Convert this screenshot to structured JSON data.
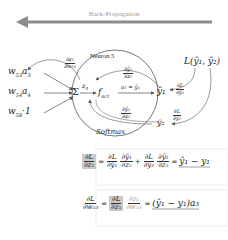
{
  "header": {
    "title": "Back-Propagation"
  },
  "inputs": [
    {
      "weight": "w",
      "weight_sub": "53",
      "act": "a",
      "act_sub": "3"
    },
    {
      "weight": "w",
      "weight_sub": "54",
      "act": "a",
      "act_sub": "4"
    },
    {
      "weight": "w",
      "weight_sub": "58",
      "act": "·1",
      "act_sub": ""
    }
  ],
  "neuron": {
    "title": "Neuron 5",
    "sum_symbol": "Σ",
    "z": "z",
    "z_sub": "5",
    "fact": "f",
    "fact_sub": "act",
    "a_eq": "a₅ = ŷ₁",
    "softmax_label": "Softmax",
    "dy1_dz5_num": "∂ŷ₁",
    "dy1_dz5_den": "∂z₅",
    "dy2_dz5_num": "∂ŷ₂",
    "dy2_dz5_den": "∂z₅"
  },
  "weight_grad": {
    "num": "∂z₅",
    "den": "∂w₅₃"
  },
  "outputs": {
    "y1": "ŷ₁",
    "y2": "ŷ₂",
    "loss": "L(ŷ₁, ŷ₂)",
    "dL_dy1_num": "∂L",
    "dL_dy1_den": "∂ŷ₁",
    "dL_dy2_num": "∂L",
    "dL_dy2_den": "∂ŷ₂"
  },
  "equations": {
    "eq1": {
      "lhs_num": "∂L",
      "lhs_den": "∂z₅",
      "t1a_num": "∂L",
      "t1a_den": "∂ŷ₁",
      "t1b_num": "∂ŷ₁",
      "t1b_den": "∂z₅",
      "plus": "+",
      "t2a_num": "∂L",
      "t2a_den": "∂ŷ₂",
      "t2b_num": "∂ŷ₂",
      "t2b_den": "∂z₅",
      "eq": "=",
      "result": "ŷ₁ − y₁"
    },
    "eq2": {
      "lhs_num": "∂L",
      "lhs_den": "∂w₅₃",
      "eq": "=",
      "t1_num": "∂L",
      "t1_den": "∂z₅",
      "t2_num": "∂z₅",
      "t2_den": "∂w₅₃",
      "result": "(ŷ₁ − y₁)a₃"
    }
  },
  "colors": {
    "arrow": "#8c8c8c",
    "line": "#555555",
    "highlight": "#c9c9c9"
  }
}
